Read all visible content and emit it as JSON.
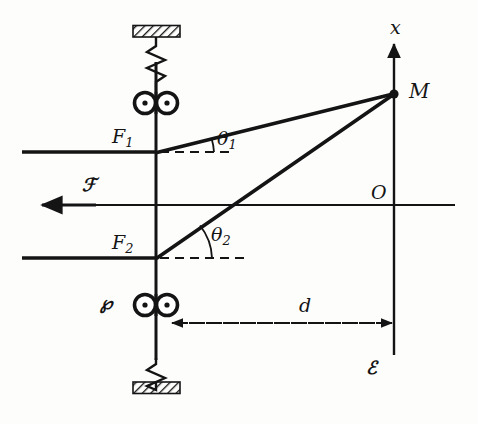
{
  "figure": {
    "background_color": "#fdfdfc",
    "ink_color": "#141414"
  },
  "labels": {
    "axis_x": "x",
    "origin": "O",
    "point_m": "M",
    "mirror_top": "F",
    "mirror_top_sub": "1",
    "mirror_bottom": "F",
    "mirror_bottom_sub": "2",
    "angle_top": "θ",
    "angle_top_sub": "1",
    "angle_bottom": "θ",
    "angle_bottom_sub": "2",
    "distance": "d",
    "source": "ℰ",
    "screen": "ℱ",
    "piezo": "℘"
  },
  "geometry": {
    "vertical_bar_x": 156,
    "axis_x_position": 394,
    "mirror_top_y": 152,
    "optic_axis_y": 205,
    "mirror_bottom_y": 258,
    "point_m": {
      "x": 394,
      "y": 94
    },
    "distance_arrow": {
      "x_start": 158,
      "x_end": 394,
      "y": 323
    },
    "angle_top_deg": 14,
    "angle_bottom_deg": 36
  },
  "elements": [
    {
      "name": "top-fixed-support",
      "kind": "hatched-block"
    },
    {
      "name": "top-spring",
      "kind": "spring"
    },
    {
      "name": "top-roller-pair",
      "kind": "double-circle"
    },
    {
      "name": "mirror-f1",
      "kind": "mirror-line"
    },
    {
      "name": "optic-axis",
      "kind": "axis-line"
    },
    {
      "name": "mirror-f2",
      "kind": "mirror-line"
    },
    {
      "name": "bottom-roller-pair",
      "kind": "double-circle"
    },
    {
      "name": "bottom-spring",
      "kind": "spring"
    },
    {
      "name": "bottom-fixed-support",
      "kind": "hatched-block"
    },
    {
      "name": "ray-upper",
      "kind": "ray"
    },
    {
      "name": "ray-lower",
      "kind": "ray"
    },
    {
      "name": "x-axis",
      "kind": "arrow-axis"
    },
    {
      "name": "distance-measure",
      "kind": "dashed-double-arrow"
    },
    {
      "name": "source-arrow",
      "kind": "left-arrow"
    }
  ]
}
